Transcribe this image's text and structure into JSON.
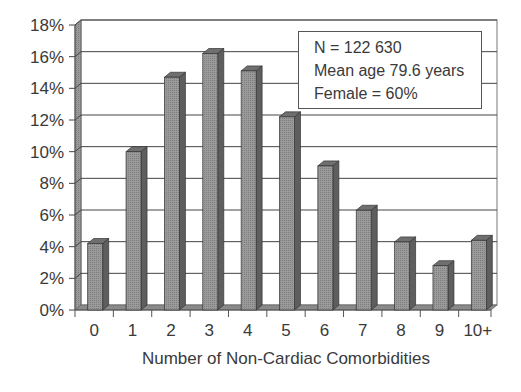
{
  "chart_data": {
    "type": "bar",
    "title": "",
    "xlabel": "Number of Non-Cardiac Comorbidities",
    "ylabel": "",
    "categories": [
      "0",
      "1",
      "2",
      "3",
      "4",
      "5",
      "6",
      "7",
      "8",
      "9",
      "10+"
    ],
    "values": [
      4.2,
      10.0,
      14.7,
      16.2,
      15.1,
      12.2,
      9.1,
      6.3,
      4.3,
      2.8,
      4.4
    ],
    "value_unit": "%",
    "ylim": [
      0,
      18
    ],
    "yticks": [
      "0%",
      "2%",
      "4%",
      "6%",
      "8%",
      "10%",
      "12%",
      "14%",
      "16%",
      "18%"
    ],
    "grid": true,
    "style": "3d-bar",
    "bar_color": "#8c8c8c",
    "annotations": [
      "N = 122 630",
      "Mean age 79.6 years",
      "Female = 60%"
    ]
  },
  "legend": {
    "lines": [
      "N = 122 630",
      "Mean age 79.6 years",
      "Female = 60%"
    ]
  }
}
